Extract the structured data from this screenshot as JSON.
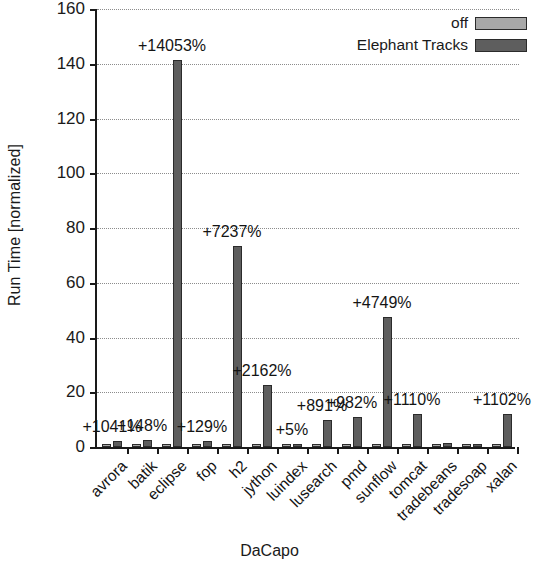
{
  "chart_data": {
    "type": "bar",
    "title": "",
    "xlabel": "DaCapo",
    "ylabel": "Run Time [normalized]",
    "ylim": [
      0,
      160
    ],
    "ytick_step": 20,
    "yticks": [
      0,
      20,
      40,
      60,
      80,
      100,
      120,
      140,
      160
    ],
    "grid": true,
    "legend_position": "top-right",
    "categories": [
      "avrora",
      "batik",
      "eclipse",
      "fop",
      "h2",
      "jython",
      "luindex",
      "lusearch",
      "pmd",
      "sunflow",
      "tomcat",
      "tradebeans",
      "tradesoap",
      "xalan"
    ],
    "series": [
      {
        "name": "off",
        "color": "#a8a8a8",
        "values": [
          1.0,
          1.0,
          1.0,
          1.0,
          1.0,
          1.0,
          1.0,
          1.0,
          1.0,
          1.0,
          1.0,
          1.0,
          1.0,
          1.0
        ]
      },
      {
        "name": "Elephant Tracks",
        "color": "#5e5e5e",
        "values": [
          2.04,
          2.48,
          141.5,
          2.29,
          73.4,
          22.6,
          1.05,
          9.9,
          10.8,
          47.5,
          12.1,
          1.3,
          1.2,
          12.0
        ]
      }
    ],
    "annotations": [
      {
        "category": "avrora",
        "text": "+1041%"
      },
      {
        "category": "batik",
        "text": "+148%"
      },
      {
        "category": "eclipse",
        "text": "+14053%"
      },
      {
        "category": "fop",
        "text": "+129%"
      },
      {
        "category": "h2",
        "text": "+7237%"
      },
      {
        "category": "jython",
        "text": "+2162%"
      },
      {
        "category": "luindex",
        "text": "+5%"
      },
      {
        "category": "lusearch",
        "text": "+891%"
      },
      {
        "category": "pmd",
        "text": "+982%"
      },
      {
        "category": "sunflow",
        "text": "+4749%"
      },
      {
        "category": "tomcat",
        "text": "+1110%"
      },
      {
        "category": "xalan",
        "text": "+1102%"
      }
    ]
  },
  "legend": {
    "items": [
      {
        "label": "off",
        "swatch": "off"
      },
      {
        "label": "Elephant Tracks",
        "swatch": "et"
      }
    ]
  },
  "axes": {
    "y_title": "Run Time [normalized]",
    "x_title": "DaCapo"
  }
}
